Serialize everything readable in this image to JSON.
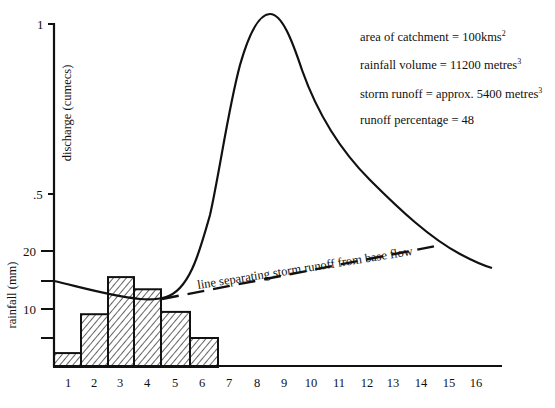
{
  "chart_data": {
    "type": "bar+line",
    "title": "",
    "categories": [
      "1",
      "2",
      "3",
      "4",
      "5",
      "6",
      "7",
      "8",
      "9",
      "10",
      "11",
      "12",
      "13",
      "14",
      "15",
      "16"
    ],
    "rainfall": {
      "label": "rainfall (mm)",
      "ticks": [
        10,
        20
      ],
      "minor_ticks": [
        5,
        15
      ],
      "ylim": [
        0,
        20
      ],
      "values": [
        2.4,
        9.1,
        15.5,
        13.4,
        9.5,
        5.0
      ],
      "hatched": true
    },
    "discharge": {
      "label": "discharge (cumecs)",
      "ticks": [
        ".5",
        "1"
      ],
      "ylim": [
        0,
        1
      ],
      "hydrograph_points": [
        [
          0,
          0.28
        ],
        [
          1,
          0.245
        ],
        [
          2,
          0.225
        ],
        [
          3,
          0.215
        ],
        [
          3.5,
          0.22
        ],
        [
          4,
          0.26
        ],
        [
          4.5,
          0.36
        ],
        [
          5,
          0.55
        ],
        [
          5.5,
          0.76
        ],
        [
          6,
          0.92
        ],
        [
          6.5,
          1.0
        ],
        [
          7,
          0.98
        ],
        [
          7.5,
          0.88
        ],
        [
          8,
          0.78
        ],
        [
          9,
          0.63
        ],
        [
          10,
          0.52
        ],
        [
          11,
          0.44
        ],
        [
          12,
          0.38
        ],
        [
          13,
          0.33
        ],
        [
          14,
          0.29
        ],
        [
          15,
          0.27
        ]
      ],
      "peak_x": 8.4,
      "peak_y": 1.0
    },
    "separation_line": {
      "label": "line separating storm runoff from base flow",
      "style": "dashed",
      "from": [
        4.3,
        0.215
      ],
      "to": [
        14.7,
        0.36
      ]
    },
    "annotations": [
      {
        "text": "area of catchment = 100kms",
        "sup": "2"
      },
      {
        "text": "rainfall volume = 11200 metres",
        "sup": "3"
      },
      {
        "text": "storm runoff = approx. 5400 metres",
        "sup": "3"
      },
      {
        "text": "runoff percentage = 48",
        "sup": ""
      }
    ],
    "xlabel": "",
    "grid": false,
    "legend": "none"
  },
  "labels": {
    "y_discharge": "discharge (cumecs)",
    "y_rainfall": "rainfall (mm)",
    "tick_1": "1",
    "tick_half": ".5",
    "tick_20": "20",
    "tick_10": "10",
    "separation": "line separating storm runoff from base flow"
  }
}
